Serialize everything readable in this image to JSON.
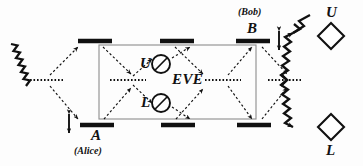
{
  "figure": {
    "type": "optical-interferometer-schematic",
    "title_text": "",
    "background_color": "#fdfdfd",
    "ink_color": "#111111",
    "box_border_color": "#888888"
  },
  "labels": {
    "eve": "EVE",
    "alice_mirror": "A",
    "alice_name": "(Alice)",
    "bob_mirror": "B",
    "bob_name": "(Bob)",
    "eve_upper_device": "U",
    "eve_lower_device": "L",
    "detector_upper": "U",
    "detector_lower": "L"
  },
  "components": {
    "beam_splitters": [
      {
        "name": "input-beam-splitter",
        "x1": 30,
        "y1": 80,
        "x2": 63,
        "y2": 80
      },
      {
        "name": "eve-left-beam-splitter",
        "x1": 110,
        "y1": 80,
        "x2": 146,
        "y2": 80
      },
      {
        "name": "eve-right-beam-splitter",
        "x1": 205,
        "y1": 80,
        "x2": 241,
        "y2": 80
      },
      {
        "name": "output-beam-splitter",
        "x1": 268,
        "y1": 80,
        "x2": 301,
        "y2": 80
      }
    ],
    "mirrors": [
      {
        "name": "mirror-top-left",
        "x1": 78,
        "y1": 41,
        "x2": 112,
        "y2": 41
      },
      {
        "name": "mirror-top-middle",
        "x1": 160,
        "y1": 41,
        "x2": 194,
        "y2": 41
      },
      {
        "name": "mirror-top-right-bob",
        "x1": 236,
        "y1": 41,
        "x2": 270,
        "y2": 41
      },
      {
        "name": "mirror-bottom-left-alice",
        "x1": 80,
        "y1": 125,
        "x2": 114,
        "y2": 125
      },
      {
        "name": "mirror-bottom-middle",
        "x1": 161,
        "y1": 125,
        "x2": 195,
        "y2": 125
      },
      {
        "name": "mirror-bottom-right",
        "x1": 237,
        "y1": 125,
        "x2": 271,
        "y2": 125
      }
    ],
    "eve_box": {
      "x": 99,
      "y": 45,
      "width": 157,
      "height": 74
    },
    "eve_devices": [
      {
        "name": "eve-upper-detector",
        "cx": 161,
        "cy": 64,
        "r": 9
      },
      {
        "name": "eve-lower-detector",
        "cx": 161,
        "cy": 103,
        "r": 9
      }
    ],
    "detectors": [
      {
        "name": "detector-upper-diamond",
        "cx": 331,
        "cy": 36,
        "size": 13
      },
      {
        "name": "detector-lower-diamond",
        "cx": 331,
        "cy": 127,
        "size": 13
      }
    ],
    "displacement_arrows": [
      {
        "name": "alice-displacement-arrow",
        "x": 69,
        "y_top": 112,
        "y_bottom": 132
      },
      {
        "name": "bob-displacement-arrow",
        "x": 279,
        "y_top": 30,
        "y_bottom": 50
      }
    ],
    "wavy_beams": [
      {
        "name": "input-photon-beam",
        "x1": 11,
        "y1": 45,
        "x2": 48,
        "y2": 80
      },
      {
        "name": "output-beam-to-upper-detector",
        "x1": 285,
        "y1": 80,
        "x2": 322,
        "y2": 45
      },
      {
        "name": "output-beam-to-lower-detector",
        "x1": 285,
        "y1": 80,
        "x2": 322,
        "y2": 117
      }
    ]
  }
}
